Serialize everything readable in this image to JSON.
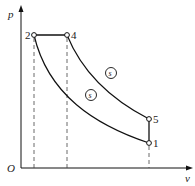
{
  "diagram": {
    "type": "p-v diagram",
    "axes": {
      "y_label": "p",
      "x_label": "v",
      "origin_label": "O"
    },
    "points": [
      {
        "id": "1",
        "label": "1"
      },
      {
        "id": "2",
        "label": "2"
      },
      {
        "id": "4",
        "label": "4"
      },
      {
        "id": "5",
        "label": "5"
      }
    ],
    "process_labels": [
      {
        "id": "upper",
        "label": "s"
      },
      {
        "id": "lower",
        "label": "s"
      }
    ],
    "colors": {
      "line": "#111111",
      "dashed": "#444444"
    }
  }
}
